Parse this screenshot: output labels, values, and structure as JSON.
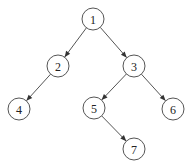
{
  "diagram": {
    "type": "binary-tree",
    "directed": true,
    "node_radius": 11,
    "colors": {
      "stroke": "#555555",
      "fill": "#ffffff",
      "text": "#222222",
      "arrow": "#333333"
    },
    "nodes": [
      {
        "id": "1",
        "label": "1",
        "x": 93,
        "y": 19
      },
      {
        "id": "2",
        "label": "2",
        "x": 58,
        "y": 66
      },
      {
        "id": "3",
        "label": "3",
        "x": 134,
        "y": 66
      },
      {
        "id": "4",
        "label": "4",
        "x": 19,
        "y": 109
      },
      {
        "id": "5",
        "label": "5",
        "x": 94,
        "y": 108
      },
      {
        "id": "6",
        "label": "6",
        "x": 173,
        "y": 109
      },
      {
        "id": "7",
        "label": "7",
        "x": 134,
        "y": 149
      }
    ],
    "edges": [
      {
        "from": "1",
        "to": "2"
      },
      {
        "from": "1",
        "to": "3"
      },
      {
        "from": "2",
        "to": "4"
      },
      {
        "from": "3",
        "to": "5"
      },
      {
        "from": "3",
        "to": "6"
      },
      {
        "from": "5",
        "to": "7"
      }
    ]
  }
}
